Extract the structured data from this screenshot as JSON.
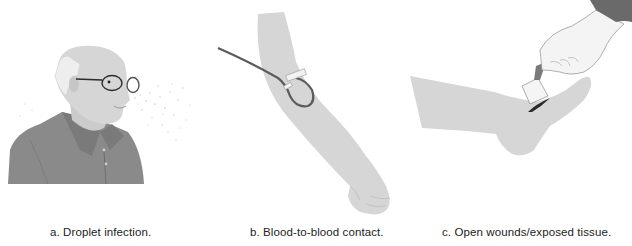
{
  "figure": {
    "panels": [
      {
        "id": "a",
        "caption": "a. Droplet infection.",
        "subject": "elderly-man-sneezing-droplets"
      },
      {
        "id": "b",
        "caption": "b. Blood-to-blood contact.",
        "subject": "arm-with-iv-line"
      },
      {
        "id": "c",
        "caption": "c. Open wounds/exposed tissue.",
        "subject": "hand-dressing-foot-wound"
      }
    ],
    "colors": {
      "skin": "#d6d6d6",
      "skin_shadow": "#bdbdbd",
      "shirt": "#8a8a8a",
      "shirt_dark": "#6e6e6e",
      "tube": "#5c5c5c",
      "sleeve": "#6a6a6a",
      "wound": "#2a2a2a",
      "background": "#ffffff"
    }
  }
}
